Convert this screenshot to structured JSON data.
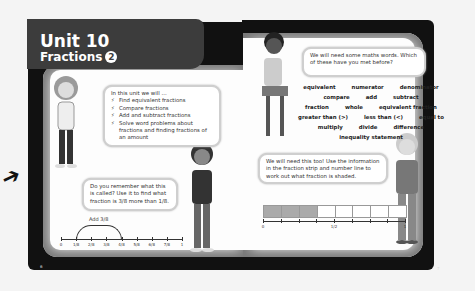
{
  "header": {
    "unit": "Unit 10",
    "topic": "Fractions",
    "topic_badge": "2"
  },
  "left_page": {
    "page_number": "6",
    "intro_bubble": {
      "lead": "In this unit we will ...",
      "bullet_icon": "lightning-icon",
      "items": [
        "Find equivalent fractions",
        "Compare fractions",
        "Add and subtract fractions",
        "Solve word problems about fractions and finding fractions of an amount"
      ]
    },
    "question_bubble": {
      "text": "Do you remember what this is called? Use it to find what fraction is 3/8 more than 1/8."
    },
    "number_line": {
      "arc_label": "Add 3/8",
      "tick_labels": [
        "0",
        "1/8",
        "2/8",
        "3/8",
        "4/8",
        "5/8",
        "6/8",
        "7/8",
        "1"
      ],
      "arc_from_index": 1,
      "arc_to_index": 4
    }
  },
  "right_page": {
    "page_number": "7",
    "words_bubble": {
      "text": "We will need some maths words. Which of these have you met before?"
    },
    "word_rows": [
      [
        "equivalent",
        "numerator",
        "denominator"
      ],
      [
        "compare",
        "add",
        "subtract"
      ],
      [
        "fraction",
        "whole",
        "equivalent fraction"
      ],
      [
        "greater than (>)",
        "less than (<)",
        "equal to"
      ],
      [
        "multiply",
        "divide",
        "difference"
      ],
      [
        "inequality statement"
      ]
    ],
    "strip_bubble": {
      "text": "We will need this too! Use the information in the fraction strip and number line to work out what fraction is shaded."
    },
    "fraction_strip": {
      "cells": 8,
      "shaded": 3,
      "labels": {
        "start": "0",
        "mid": "1/2",
        "end": "1"
      }
    }
  },
  "margin": {
    "arrow": "arrow-icon"
  },
  "colors": {
    "header_bg": "#3c3c3c",
    "frame": "#111111",
    "shaded": "#aaaaaa"
  }
}
